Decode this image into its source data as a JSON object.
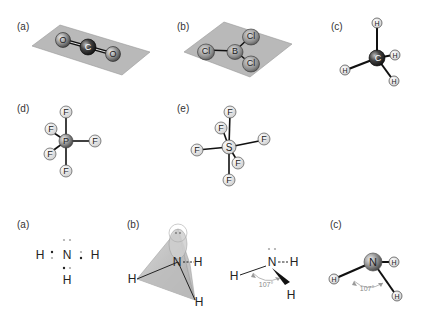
{
  "panels_top": {
    "a": {
      "label": "(a)",
      "molecule": "CO2",
      "atoms": [
        "O",
        "C",
        "O"
      ],
      "geometry": "linear"
    },
    "b": {
      "label": "(b)",
      "molecule": "BCl3",
      "atoms": [
        "Cl",
        "B",
        "Cl",
        "Cl"
      ],
      "geometry": "trigonal planar"
    },
    "c": {
      "label": "(c)",
      "molecule": "CH4",
      "atoms": [
        "H",
        "C",
        "H",
        "H",
        "H"
      ],
      "geometry": "tetrahedral"
    },
    "d": {
      "label": "(d)",
      "molecule": "PF5",
      "atoms": [
        "P",
        "F",
        "F",
        "F",
        "F",
        "F"
      ],
      "geometry": "trigonal bipyramidal"
    },
    "e": {
      "label": "(e)",
      "molecule": "SF6",
      "atoms": [
        "S",
        "F",
        "F",
        "F",
        "F",
        "F",
        "F"
      ],
      "geometry": "octahedral"
    }
  },
  "panels_bottom": {
    "a": {
      "label": "(a)",
      "lewis": {
        "center": "N",
        "H1": "H",
        "H2": "H",
        "H3": "H"
      }
    },
    "b": {
      "label": "(b)",
      "center": "N",
      "H1": "H",
      "H2": "H",
      "H3": "H"
    },
    "wedge": {
      "center": "N",
      "H1": "H",
      "H2": "H",
      "H3": "H",
      "angle": "107°"
    },
    "c": {
      "label": "(c)",
      "center": "N",
      "H1": "H",
      "H2": "H",
      "H3": "H",
      "angle": "107°"
    }
  },
  "colors": {
    "plane": "#b8b8b8",
    "atom_light": "#e6e6e6",
    "atom_dark": "#333333",
    "bond": "#111111",
    "lone_pair": "#aaaaaa"
  }
}
